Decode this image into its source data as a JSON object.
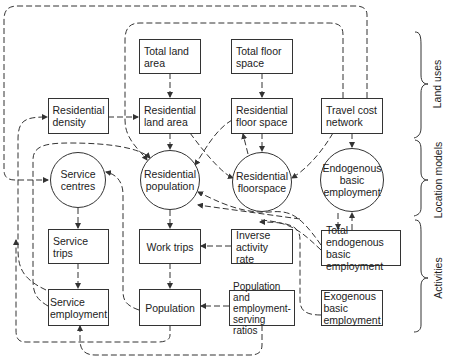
{
  "diagram": {
    "boxes": {
      "total_land_area": "Total land area",
      "total_floor_space": "Total floor space",
      "residential_density": "Residential density",
      "residential_land_area": "Residential land area",
      "residential_floor_space": "Residential floor space",
      "travel_cost_network": "Travel cost network",
      "service_trips": "Service trips",
      "work_trips": "Work trips",
      "inverse_activity_rate": "Inverse activity rate",
      "total_endogenous_basic_employment": "Total endogenous basic employment",
      "service_employment": "Service employment",
      "population": "Population",
      "population_employment_ratios": "Population and employment-serving ratios",
      "exogenous_basic_employment": "Exogenous basic employment"
    },
    "circles": {
      "service_centres": "Service centres",
      "residential_population": "Residential population",
      "residential_floorspace": "Residential floorspace",
      "endogenous_basic_employment": "Endogenous basic employment"
    },
    "side_labels": {
      "land_uses": "Land uses",
      "location_models": "Location models",
      "activities": "Activities"
    },
    "line_color": "#333333"
  }
}
